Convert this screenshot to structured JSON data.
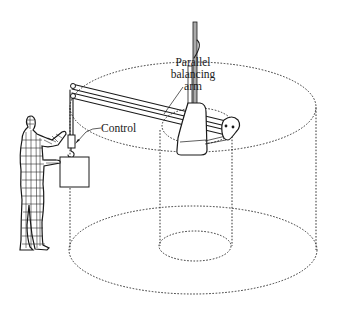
{
  "figure": {
    "type": "technical line drawing",
    "labels": {
      "arm": [
        "Parallel",
        "balancing",
        "arm"
      ],
      "control": "Control"
    },
    "components": [
      "vertical mast",
      "parallel balancing arm",
      "pivot housing",
      "counterweight",
      "control handle",
      "hook",
      "load box",
      "operator figure",
      "outer cylindrical work envelope (dotted)",
      "inner cylindrical dead zone (dotted)"
    ],
    "colors": {
      "line": "#1a1a1a",
      "background": "#ffffff"
    }
  }
}
